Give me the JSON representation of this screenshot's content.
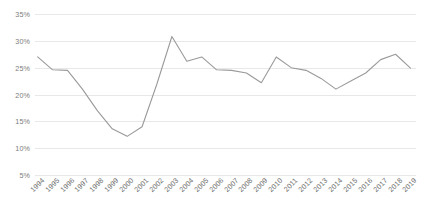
{
  "chart_data": {
    "type": "line",
    "title": "",
    "subtitle": "",
    "xlabel": "",
    "ylabel": "",
    "grid": true,
    "legend": false,
    "legend_position": "none",
    "line_color": "#9a9a9a",
    "categories": [
      "1994",
      "1995",
      "1996",
      "1997",
      "1998",
      "1999",
      "2000",
      "2001",
      "2002",
      "2003",
      "2004",
      "2005",
      "2006",
      "2007",
      "2008",
      "2009",
      "2010",
      "2011",
      "2012",
      "2013",
      "2014",
      "2015",
      "2016",
      "2017",
      "2018",
      "2019"
    ],
    "values": [
      27.0,
      24.6,
      24.5,
      21.0,
      17.0,
      13.6,
      12.2,
      14.0,
      22.0,
      30.8,
      26.2,
      27.0,
      24.6,
      24.5,
      24.0,
      22.2,
      27.0,
      25.0,
      24.5,
      23.0,
      21.0,
      22.5,
      24.0,
      26.5,
      27.5,
      24.9
    ],
    "value_suffix": "%",
    "ylim": [
      5,
      35
    ],
    "yticks": [
      "5%",
      "10%",
      "15%",
      "20%",
      "25%",
      "30%",
      "35%"
    ],
    "ytick_values": [
      5,
      10,
      15,
      20,
      25,
      30,
      35
    ]
  }
}
